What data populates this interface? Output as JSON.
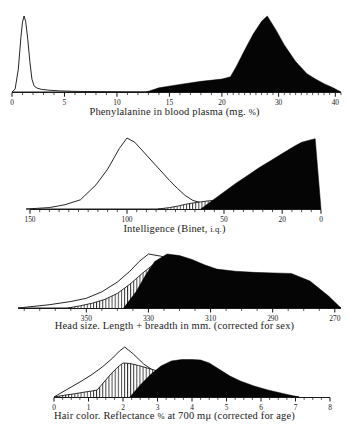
{
  "figure": {
    "title": "",
    "legend_note": ""
  },
  "panels": [
    {
      "id": "phenylalanine",
      "caption_main": "Phenylalanine in blood plasma (mg. ",
      "caption_pct": "%",
      "caption_tail": ")",
      "caption_full": "Phenylalanine in blood plasma (mg. %)",
      "axis": {
        "reversed": false,
        "tick_labels": [
          "0",
          "5",
          "10",
          "15",
          "20",
          "30",
          "40"
        ],
        "tick_values": [
          0,
          5,
          10,
          15,
          20,
          30,
          40
        ]
      }
    },
    {
      "id": "intelligence",
      "caption_main": "Intelligence (Binet, ",
      "caption_sc": "i.q.",
      "caption_tail": ")",
      "caption_full": "Intelligence (Binet, I.Q.)",
      "axis": {
        "reversed": true,
        "tick_labels": [
          "150",
          "100",
          "50",
          "20",
          "0"
        ],
        "tick_values": [
          150,
          100,
          50,
          20,
          0
        ]
      }
    },
    {
      "id": "head-size",
      "caption_main": "Head size.  Length + breadth in mm. (corrected for sex)",
      "caption_full": "Head size.  Length + breadth in mm. (corrected for sex)",
      "axis": {
        "reversed": true,
        "tick_labels": [
          "350",
          "330",
          "310",
          "290",
          "270"
        ],
        "tick_values": [
          350,
          330,
          310,
          290,
          270
        ]
      }
    },
    {
      "id": "hair-color",
      "caption_main": "Hair color.  Reflectance ",
      "caption_pct": "%",
      "caption_tail": " at 700 mμ (corrected for age)",
      "caption_full": "Hair color.  Reflectance % at 700 mμ (corrected for age)",
      "axis": {
        "reversed": false,
        "tick_labels": [
          "0",
          "1",
          "2",
          "3",
          "4",
          "5",
          "6",
          "7",
          "8"
        ],
        "tick_values": [
          0,
          1,
          2,
          3,
          4,
          5,
          6,
          7,
          8
        ]
      }
    }
  ],
  "chart_data": [
    {
      "type": "area",
      "id": "phenylalanine",
      "title": "Phenylalanine in blood plasma (mg. %)",
      "xlabel": "Phenylalanine in blood plasma (mg. %)",
      "ylabel": "Frequency",
      "grid": false,
      "legend": "none",
      "xticks": [
        0,
        5,
        10,
        15,
        20,
        30,
        40
      ],
      "xtick_labels": [
        "0",
        "5",
        "10",
        "15",
        "20",
        "30",
        "40"
      ],
      "x_reversed": false,
      "series": [
        {
          "name": "normal (open outline)",
          "style": "open",
          "x": [
            0.0,
            0.3,
            0.6,
            0.85,
            1.0,
            1.15,
            1.3,
            1.5,
            1.7,
            1.9,
            2.1,
            2.4,
            2.8,
            3.4,
            4.5,
            6.0,
            9.0,
            13.0
          ],
          "y": [
            0.0,
            0.04,
            0.3,
            0.72,
            0.92,
            1.0,
            0.93,
            0.7,
            0.4,
            0.17,
            0.08,
            0.05,
            0.035,
            0.025,
            0.015,
            0.008,
            0.004,
            0.0
          ]
        },
        {
          "name": "phenylketonuric (solid black)",
          "style": "solid",
          "x": [
            12.8,
            14.0,
            16.0,
            18.0,
            20.0,
            21.5,
            22.5,
            24.0,
            25.5,
            27.0,
            28.0,
            29.5,
            31.0,
            33.0,
            35.0,
            36.5,
            38.0,
            39.5,
            41.0
          ],
          "y": [
            0.0,
            0.055,
            0.1,
            0.14,
            0.17,
            0.2,
            0.33,
            0.55,
            0.76,
            0.93,
            1.0,
            0.82,
            0.62,
            0.4,
            0.24,
            0.17,
            0.11,
            0.06,
            0.0
          ]
        }
      ]
    },
    {
      "type": "area",
      "id": "intelligence",
      "title": "Intelligence (Binet, I.Q.)",
      "xlabel": "Intelligence (Binet, I.Q.)",
      "ylabel": "Frequency",
      "grid": false,
      "legend": "none",
      "xticks": [
        150,
        100,
        50,
        20,
        0
      ],
      "xtick_labels": [
        "150",
        "100",
        "50",
        "20",
        "0"
      ],
      "x_reversed": true,
      "series": [
        {
          "name": "normal (open outline)",
          "style": "open",
          "x": [
            152,
            140,
            132,
            124,
            116,
            110,
            104,
            100,
            96,
            90,
            84,
            78,
            74,
            70,
            66,
            62,
            58,
            54,
            50,
            44,
            38,
            30,
            22
          ],
          "y": [
            0.0,
            0.02,
            0.06,
            0.13,
            0.34,
            0.56,
            0.85,
            1.0,
            0.94,
            0.76,
            0.58,
            0.4,
            0.29,
            0.19,
            0.12,
            0.09,
            0.075,
            0.065,
            0.055,
            0.04,
            0.028,
            0.015,
            0.0
          ]
        },
        {
          "name": "heterozygote (hatched)",
          "style": "hatch",
          "x": [
            84,
            78,
            74,
            70,
            66,
            62,
            58,
            54,
            50,
            46,
            42,
            38,
            34,
            30,
            26,
            22,
            18,
            14,
            10,
            6,
            2
          ],
          "y": [
            0.0,
            0.02,
            0.04,
            0.065,
            0.085,
            0.1,
            0.115,
            0.12,
            0.105,
            0.085,
            0.07,
            0.06,
            0.05,
            0.045,
            0.04,
            0.035,
            0.03,
            0.025,
            0.02,
            0.012,
            0.0
          ]
        },
        {
          "name": "phenylketonuric (solid black)",
          "style": "solid",
          "x": [
            62,
            56,
            50,
            44,
            38,
            32,
            26,
            20,
            14,
            10,
            6,
            3,
            0
          ],
          "y": [
            0.0,
            0.12,
            0.24,
            0.36,
            0.47,
            0.58,
            0.68,
            0.78,
            0.88,
            0.94,
            0.97,
            0.99,
            0.0
          ]
        }
      ]
    },
    {
      "type": "area",
      "id": "head-size",
      "title": "Head size. Length + breadth in mm. (corrected for sex)",
      "xlabel": "Head size.  Length + breadth in mm. (corrected for sex)",
      "ylabel": "Frequency",
      "grid": false,
      "legend": "none",
      "xticks": [
        350,
        330,
        310,
        290,
        270
      ],
      "xtick_labels": [
        "350",
        "330",
        "310",
        "290",
        "270"
      ],
      "x_reversed": true,
      "series": [
        {
          "name": "normal (open outline)",
          "style": "open",
          "x": [
            372,
            362,
            355,
            350,
            345,
            340,
            336,
            333,
            330,
            326,
            322,
            318,
            314,
            310,
            306,
            300,
            294,
            288,
            282,
            276,
            268
          ],
          "y": [
            0.0,
            0.06,
            0.12,
            0.18,
            0.3,
            0.48,
            0.68,
            0.86,
            1.0,
            0.96,
            0.88,
            0.76,
            0.6,
            0.45,
            0.34,
            0.22,
            0.15,
            0.1,
            0.06,
            0.03,
            0.0
          ]
        },
        {
          "name": "heterozygote (hatched)",
          "style": "hatch",
          "x": [
            356,
            352,
            348,
            344,
            340,
            336,
            332,
            329,
            326,
            322,
            318,
            314,
            310,
            306,
            300,
            294,
            288,
            282,
            274,
            268
          ],
          "y": [
            0.0,
            0.04,
            0.09,
            0.16,
            0.27,
            0.44,
            0.64,
            0.78,
            0.86,
            0.8,
            0.7,
            0.56,
            0.42,
            0.3,
            0.19,
            0.12,
            0.07,
            0.04,
            0.015,
            0.0
          ]
        },
        {
          "name": "phenylketonuric (solid black)",
          "style": "solid",
          "x": [
            338,
            334,
            331,
            328,
            324,
            320,
            316,
            312,
            308,
            302,
            296,
            290,
            284,
            278,
            272,
            268
          ],
          "y": [
            0.0,
            0.3,
            0.6,
            0.86,
            1.0,
            0.97,
            0.9,
            0.8,
            0.72,
            0.68,
            0.66,
            0.65,
            0.64,
            0.5,
            0.22,
            0.0
          ]
        }
      ]
    },
    {
      "type": "area",
      "id": "hair-color",
      "title": "Hair color. Reflectance % at 700 mμ (corrected for age)",
      "xlabel": "Hair color.  Reflectance % at 700 mμ (corrected for age)",
      "ylabel": "Frequency",
      "grid": false,
      "legend": "none",
      "xticks": [
        0,
        1,
        2,
        3,
        4,
        5,
        6,
        7,
        8
      ],
      "xtick_labels": [
        "0",
        "1",
        "2",
        "3",
        "4",
        "5",
        "6",
        "7",
        "8"
      ],
      "x_reversed": false,
      "series": [
        {
          "name": "normal (open outline)",
          "style": "open",
          "x": [
            0.0,
            0.4,
            0.8,
            1.1,
            1.4,
            1.7,
            1.9,
            2.05,
            2.3,
            2.6,
            2.9,
            3.2,
            3.6,
            4.0,
            4.4,
            4.9,
            5.4,
            5.9,
            6.4,
            7.0
          ],
          "y": [
            0.0,
            0.16,
            0.32,
            0.45,
            0.6,
            0.78,
            0.92,
            1.0,
            0.86,
            0.66,
            0.52,
            0.44,
            0.4,
            0.38,
            0.3,
            0.22,
            0.16,
            0.1,
            0.05,
            0.0
          ]
        },
        {
          "name": "heterozygote (hatched)",
          "style": "hatch",
          "x": [
            0.0,
            0.3,
            0.6,
            0.9,
            1.1,
            1.25,
            1.45,
            1.65,
            1.85,
            2.0,
            2.2,
            2.45,
            2.7,
            3.0,
            3.3,
            3.6,
            3.9,
            4.2,
            4.5,
            4.9,
            5.3,
            5.7,
            6.1,
            6.6,
            7.1
          ],
          "y": [
            0.0,
            0.035,
            0.065,
            0.1,
            0.12,
            0.14,
            0.3,
            0.46,
            0.6,
            0.68,
            0.67,
            0.63,
            0.58,
            0.52,
            0.47,
            0.44,
            0.42,
            0.39,
            0.32,
            0.24,
            0.17,
            0.11,
            0.06,
            0.025,
            0.0
          ]
        },
        {
          "name": "phenylketonuric (solid black)",
          "style": "solid",
          "x": [
            2.2,
            2.5,
            2.8,
            3.1,
            3.4,
            3.7,
            4.0,
            4.25,
            4.5,
            4.8,
            5.1,
            5.4,
            5.8,
            6.2,
            6.7,
            7.1
          ],
          "y": [
            0.0,
            0.24,
            0.45,
            0.62,
            0.72,
            0.75,
            0.75,
            0.74,
            0.68,
            0.55,
            0.42,
            0.32,
            0.22,
            0.14,
            0.06,
            0.0
          ]
        }
      ]
    }
  ]
}
